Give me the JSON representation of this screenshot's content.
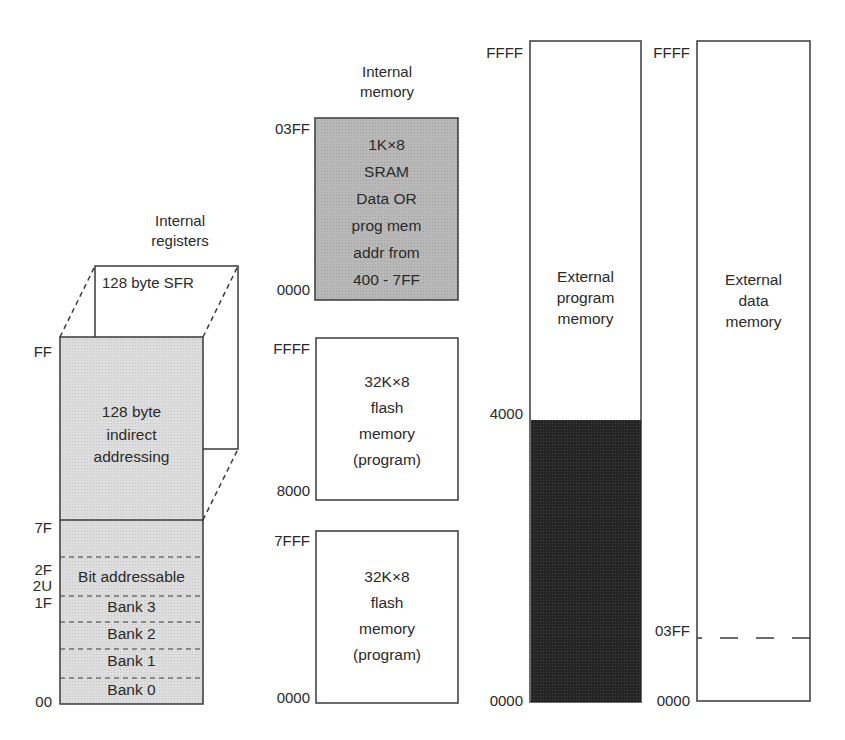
{
  "colors": {
    "stroke": "#3a3a3a",
    "light_fill": "#dcdcdc",
    "medium_fill": "#b4b4b4",
    "dark_fill": "#262626",
    "text": "#2a2a2a"
  },
  "internal_registers": {
    "title_line1": "Internal",
    "title_line2": "registers",
    "sfr_label": "128 byte SFR",
    "indirect_line1": "128 byte",
    "indirect_line2": "indirect",
    "indirect_line3": "addressing",
    "bands": [
      "Bit addressable",
      "Bank 3",
      "Bank 2",
      "Bank 1",
      "Bank 0"
    ],
    "addresses": {
      "ff": "FF",
      "7f": "7F",
      "2f": "2F",
      "2u": "2U",
      "1f": "1F",
      "00": "00"
    }
  },
  "internal_memory": {
    "title_line1": "Internal",
    "title_line2": "memory",
    "sram": {
      "lines": [
        "1K×8",
        "SRAM",
        "Data OR",
        "prog mem",
        "addr from",
        "400 - 7FF"
      ],
      "top_addr": "03FF",
      "bottom_addr": "0000"
    },
    "flash_upper": {
      "lines": [
        "32K×8",
        "flash",
        "memory",
        "(program)"
      ],
      "top_addr": "FFFF",
      "bottom_addr": "8000"
    },
    "flash_lower": {
      "lines": [
        "32K×8",
        "flash",
        "memory",
        "(program)"
      ],
      "top_addr": "7FFF",
      "bottom_addr": "0000"
    }
  },
  "external_program_memory": {
    "lines": [
      "External",
      "program",
      "memory"
    ],
    "top_addr": "FFFF",
    "mid_addr": "4000",
    "bottom_addr": "0000"
  },
  "external_data_memory": {
    "lines": [
      "External",
      "data",
      "memory"
    ],
    "top_addr": "FFFF",
    "mid_addr": "03FF",
    "bottom_addr": "0000"
  }
}
